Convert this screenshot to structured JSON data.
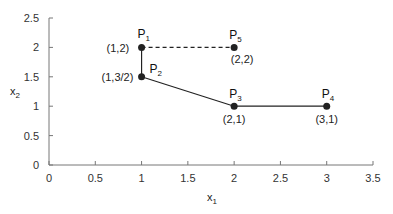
{
  "chart_data": {
    "type": "scatter",
    "title": "",
    "xlabel": "x1",
    "ylabel": "x2",
    "xlim": [
      0,
      3.5
    ],
    "ylim": [
      0,
      2.5
    ],
    "x_ticks": [
      "0",
      "0.5",
      "1",
      "1.5",
      "2",
      "2.5",
      "3",
      "3.5"
    ],
    "y_ticks": [
      "0",
      "0.5",
      "1",
      "1.5",
      "2",
      "2.5"
    ],
    "grid": false,
    "points": [
      {
        "name": "P1",
        "x": 1,
        "y": 2,
        "label": "(1,2)"
      },
      {
        "name": "P2",
        "x": 1,
        "y": 1.5,
        "label": "(1,3/2)"
      },
      {
        "name": "P3",
        "x": 2,
        "y": 1,
        "label": "(2,1)"
      },
      {
        "name": "P4",
        "x": 3,
        "y": 1,
        "label": "(3,1)"
      },
      {
        "name": "P5",
        "x": 2,
        "y": 2,
        "label": "(2,2)"
      }
    ],
    "segments": [
      {
        "from": "P1",
        "to": "P2",
        "style": "solid"
      },
      {
        "from": "P2",
        "to": "P3",
        "style": "solid"
      },
      {
        "from": "P3",
        "to": "P4",
        "style": "solid"
      },
      {
        "from": "P1",
        "to": "P5",
        "style": "dashed"
      }
    ]
  }
}
